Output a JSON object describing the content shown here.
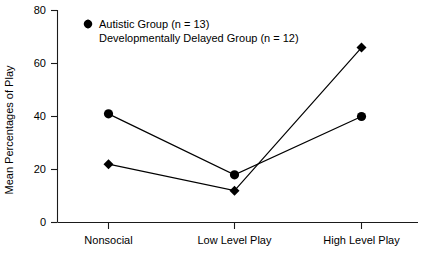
{
  "chart_data": {
    "type": "line",
    "title": "",
    "subtitle": "",
    "xlabel": "",
    "ylabel": "Mean Percentages of Play",
    "categories": [
      "Nonsocial",
      "Low Level Play",
      "High Level Play"
    ],
    "yticks": [
      "0",
      "20",
      "40",
      "60",
      "80"
    ],
    "ylim": [
      0,
      80
    ],
    "grid": false,
    "legend_position": "top-left-inside",
    "series": [
      {
        "name": "Autistic Group (n = 13)",
        "marker": "circle",
        "values": [
          41,
          18,
          40
        ]
      },
      {
        "name": "Developmentally Delayed Group (n = 12)",
        "marker": "diamond",
        "values": [
          22,
          12,
          66
        ]
      }
    ]
  },
  "legend": {
    "entries": [
      {
        "marker_name": "circle-marker-icon",
        "label": "Autistic Group (n = 13)"
      },
      {
        "marker_name": "diamond-marker-icon",
        "label": "Developmentally Delayed Group (n = 12)"
      }
    ]
  },
  "axes": {
    "y_title": "Mean Percentages of Play",
    "y_tick_0": "0",
    "y_tick_20": "20",
    "y_tick_40": "40",
    "y_tick_60": "60",
    "y_tick_80": "80",
    "x_cat_0": "Nonsocial",
    "x_cat_1": "Low Level Play",
    "x_cat_2": "High Level Play"
  }
}
